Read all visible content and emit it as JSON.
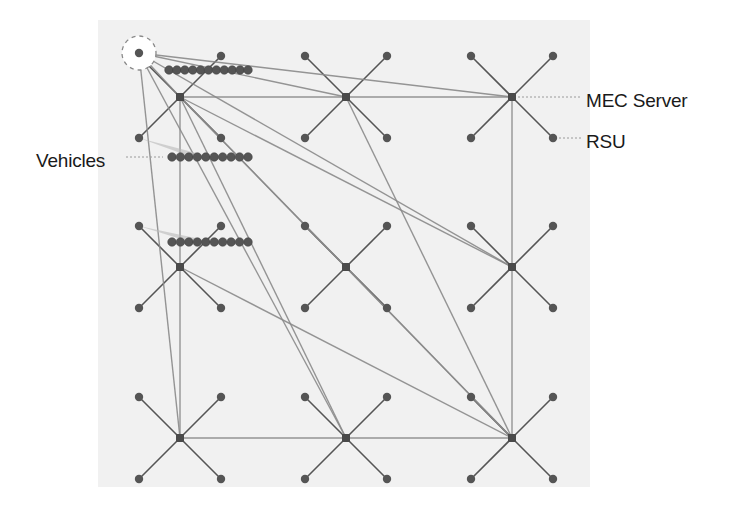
{
  "labels": {
    "mec_server": "MEC Server",
    "rsu": "RSU",
    "vehicles": "Vehicles"
  },
  "colors": {
    "background": "#ffffff",
    "panel": "#f1f1f1",
    "link": "#8a8a8a",
    "node": "#555555",
    "server": "#4a4a4a",
    "leader": "#9a9a9a",
    "text": "#1a1a1a"
  },
  "grid": {
    "servers": [
      {
        "id": "S11",
        "x": 180,
        "y": 97
      },
      {
        "id": "S12",
        "x": 346,
        "y": 97
      },
      {
        "id": "S13",
        "x": 512,
        "y": 97
      },
      {
        "id": "S21",
        "x": 180,
        "y": 267
      },
      {
        "id": "S22",
        "x": 346,
        "y": 267
      },
      {
        "id": "S23",
        "x": 512,
        "y": 267
      },
      {
        "id": "S31",
        "x": 180,
        "y": 438
      },
      {
        "id": "S32",
        "x": 346,
        "y": 438
      },
      {
        "id": "S33",
        "x": 512,
        "y": 438
      }
    ],
    "rsu_offset": 41
  },
  "vehicle_rows": [
    {
      "y": 70,
      "x_start": 169,
      "x_end": 248,
      "count": 11
    },
    {
      "y": 157,
      "x_start": 172,
      "x_end": 248,
      "count": 10
    },
    {
      "y": 242,
      "x_start": 172,
      "x_end": 248,
      "count": 10
    }
  ],
  "highlighted_rsu": {
    "x": 139,
    "y": 53,
    "r": 17
  },
  "links": [
    [
      "S11",
      "S12"
    ],
    [
      "S12",
      "S13"
    ],
    [
      "S11",
      "S21"
    ],
    [
      "S21",
      "S31"
    ],
    [
      "S31",
      "S32"
    ],
    [
      "S32",
      "S33"
    ],
    [
      "S13",
      "S23"
    ],
    [
      "S23",
      "S33"
    ],
    [
      "S11",
      "S22"
    ],
    [
      "S22",
      "S33"
    ],
    [
      "S11",
      "S23"
    ],
    [
      "S11",
      "S33"
    ],
    [
      "S11",
      "S32"
    ],
    [
      "S21",
      "S33"
    ],
    [
      "S12",
      "S33"
    ],
    [
      "RSU0",
      "S12"
    ],
    [
      "RSU0",
      "S13"
    ],
    [
      "RSU0",
      "S23"
    ],
    [
      "RSU0",
      "S31"
    ],
    [
      "RSU0",
      "S32"
    ],
    [
      "RSU0",
      "S11"
    ]
  ],
  "legend": {
    "mec_server_anchor": {
      "x": 512,
      "y": 97
    },
    "rsu_anchor": {
      "x": 553,
      "y": 138
    },
    "vehicles_anchor": {
      "x": 169,
      "y": 157
    }
  }
}
